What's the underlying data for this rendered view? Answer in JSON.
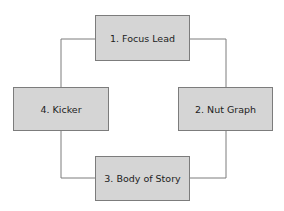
{
  "diagram": {
    "type": "cycle",
    "nodes": [
      {
        "id": "1",
        "label": "1. Focus Lead"
      },
      {
        "id": "2",
        "label": "2. Nut Graph"
      },
      {
        "id": "3",
        "label": "3. Body of Story"
      },
      {
        "id": "4",
        "label": "4. Kicker"
      }
    ],
    "edges": [
      {
        "from": "1",
        "to": "2"
      },
      {
        "from": "2",
        "to": "3"
      },
      {
        "from": "3",
        "to": "4"
      },
      {
        "from": "4",
        "to": "1"
      }
    ],
    "colors": {
      "box_fill": "#d5d5d5",
      "box_border": "#7c7c7c",
      "connector": "#7c7c7c",
      "text": "#222222"
    }
  }
}
